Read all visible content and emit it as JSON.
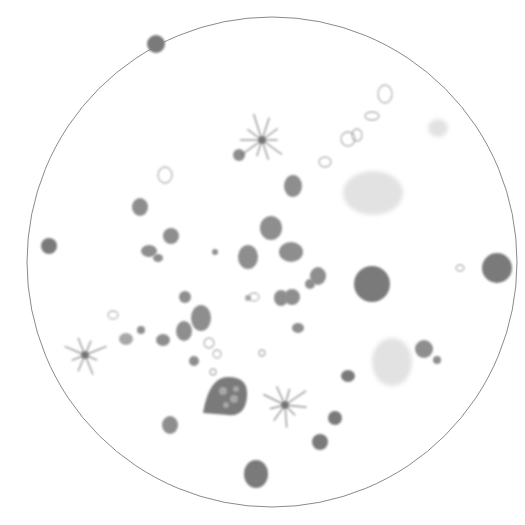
{
  "figure": {
    "type": "microscope-field-illustration",
    "background": "#ffffff",
    "field_circle": {
      "cx": 272,
      "cy": 262,
      "r": 245,
      "stroke": "#8a8a8a"
    },
    "colors": {
      "dark_cell": "#7a7a7a",
      "mid_cell": "#8e8e8e",
      "light_cell": "#a8a8a8",
      "pale_mass": "#d6d6d6",
      "ring_outline": "#9a9a9a",
      "crystal": "#6e6e6e"
    },
    "dark_cells": [
      {
        "cx": 156,
        "cy": 44,
        "rx": 9,
        "ry": 9
      },
      {
        "cx": 49,
        "cy": 246,
        "rx": 8,
        "ry": 8
      },
      {
        "cx": 372,
        "cy": 284,
        "rx": 18,
        "ry": 18
      },
      {
        "cx": 497,
        "cy": 268,
        "rx": 15,
        "ry": 15
      },
      {
        "cx": 256,
        "cy": 474,
        "rx": 12,
        "ry": 14
      },
      {
        "cx": 320,
        "cy": 442,
        "rx": 8,
        "ry": 8
      },
      {
        "cx": 335,
        "cy": 418,
        "rx": 7,
        "ry": 7
      },
      {
        "cx": 348,
        "cy": 376,
        "rx": 7,
        "ry": 6
      }
    ],
    "mid_cells": [
      {
        "cx": 140,
        "cy": 207,
        "rx": 8,
        "ry": 9
      },
      {
        "cx": 171,
        "cy": 236,
        "rx": 8,
        "ry": 8
      },
      {
        "cx": 149,
        "cy": 251,
        "rx": 8,
        "ry": 6
      },
      {
        "cx": 158,
        "cy": 258,
        "rx": 5,
        "ry": 4
      },
      {
        "cx": 248,
        "cy": 257,
        "rx": 10,
        "ry": 12
      },
      {
        "cx": 271,
        "cy": 228,
        "rx": 11,
        "ry": 12
      },
      {
        "cx": 291,
        "cy": 252,
        "rx": 12,
        "ry": 10
      },
      {
        "cx": 293,
        "cy": 186,
        "rx": 9,
        "ry": 11
      },
      {
        "cx": 292,
        "cy": 297,
        "rx": 8,
        "ry": 8
      },
      {
        "cx": 201,
        "cy": 318,
        "rx": 10,
        "ry": 13
      },
      {
        "cx": 184,
        "cy": 331,
        "rx": 8,
        "ry": 10
      },
      {
        "cx": 185,
        "cy": 297,
        "rx": 6,
        "ry": 6
      },
      {
        "cx": 239,
        "cy": 155,
        "rx": 6,
        "ry": 6
      },
      {
        "cx": 281,
        "cy": 298,
        "rx": 7,
        "ry": 8
      },
      {
        "cx": 310,
        "cy": 284,
        "rx": 5,
        "ry": 5
      },
      {
        "cx": 298,
        "cy": 328,
        "rx": 6,
        "ry": 5
      },
      {
        "cx": 170,
        "cy": 425,
        "rx": 8,
        "ry": 9
      },
      {
        "cx": 424,
        "cy": 349,
        "rx": 9,
        "ry": 9
      },
      {
        "cx": 437,
        "cy": 360,
        "rx": 4,
        "ry": 4
      },
      {
        "cx": 318,
        "cy": 276,
        "rx": 8,
        "ry": 9
      },
      {
        "cx": 194,
        "cy": 361,
        "rx": 5,
        "ry": 5
      },
      {
        "cx": 163,
        "cy": 340,
        "rx": 7,
        "ry": 6
      },
      {
        "cx": 141,
        "cy": 330,
        "rx": 4,
        "ry": 4
      },
      {
        "cx": 215,
        "cy": 252,
        "rx": 3,
        "ry": 3
      }
    ],
    "large_vacuolated_cell": {
      "cx": 228,
      "cy": 397,
      "rx": 19,
      "ry": 20
    },
    "light_cells": [
      {
        "cx": 126,
        "cy": 339,
        "rx": 7,
        "ry": 6
      },
      {
        "cx": 248,
        "cy": 298,
        "rx": 3,
        "ry": 3
      }
    ],
    "pale_masses": [
      {
        "cx": 373,
        "cy": 193,
        "rx": 30,
        "ry": 22
      },
      {
        "cx": 392,
        "cy": 362,
        "rx": 20,
        "ry": 24
      },
      {
        "cx": 438,
        "cy": 128,
        "rx": 10,
        "ry": 9
      }
    ],
    "ring_cells": [
      {
        "cx": 165,
        "cy": 175,
        "rx": 7,
        "ry": 8
      },
      {
        "cx": 325,
        "cy": 162,
        "rx": 6,
        "ry": 5
      },
      {
        "cx": 348,
        "cy": 139,
        "rx": 7,
        "ry": 7
      },
      {
        "cx": 357,
        "cy": 135,
        "rx": 5,
        "ry": 6
      },
      {
        "cx": 209,
        "cy": 343,
        "rx": 5,
        "ry": 5
      },
      {
        "cx": 217,
        "cy": 354,
        "rx": 4,
        "ry": 4
      },
      {
        "cx": 460,
        "cy": 268,
        "rx": 4,
        "ry": 3
      },
      {
        "cx": 113,
        "cy": 315,
        "rx": 5,
        "ry": 4
      },
      {
        "cx": 254,
        "cy": 297,
        "rx": 5,
        "ry": 4
      },
      {
        "cx": 213,
        "cy": 372,
        "rx": 3,
        "ry": 3
      },
      {
        "cx": 262,
        "cy": 353,
        "rx": 3,
        "ry": 3
      },
      {
        "cx": 385,
        "cy": 94,
        "rx": 7,
        "ry": 9
      },
      {
        "cx": 372,
        "cy": 116,
        "rx": 7,
        "ry": 4
      }
    ],
    "crystal_clusters": [
      {
        "cx": 262,
        "cy": 140,
        "arms": 10,
        "length": 26
      },
      {
        "cx": 85,
        "cy": 355,
        "arms": 8,
        "length": 22
      },
      {
        "cx": 285,
        "cy": 405,
        "arms": 9,
        "length": 24
      }
    ]
  }
}
